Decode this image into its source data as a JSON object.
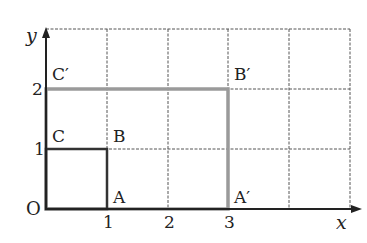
{
  "figure": {
    "type": "coordinate-grid-scaling",
    "grid": {
      "cols": 5,
      "rows": 3
    },
    "axes": {
      "x_label": "x",
      "y_label": "y",
      "origin_label": "O",
      "x_ticks": [
        "1",
        "2",
        "3"
      ],
      "y_ticks": [
        "1",
        "2"
      ]
    },
    "small_square": {
      "vertices": {
        "O": [
          0,
          0
        ],
        "A": [
          1,
          0
        ],
        "B": [
          1,
          1
        ],
        "C": [
          0,
          1
        ]
      },
      "color": "#333333"
    },
    "large_rectangle": {
      "vertices": {
        "O": [
          0,
          0
        ],
        "A'": [
          3,
          0
        ],
        "B'": [
          3,
          2
        ],
        "C'": [
          0,
          2
        ]
      },
      "color": "#9a9a9a"
    },
    "point_labels": {
      "A": "A",
      "B": "B",
      "C": "C",
      "A_prime": "A′",
      "B_prime": "B′",
      "C_prime": "C′"
    }
  }
}
